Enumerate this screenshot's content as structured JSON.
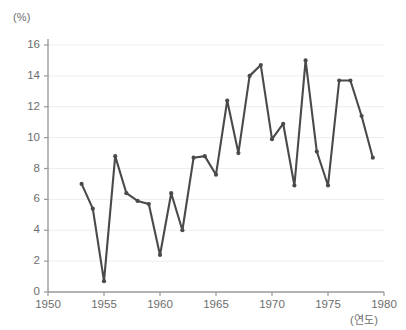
{
  "chart_data": {
    "type": "line",
    "title": "",
    "subtitle": "",
    "xlabel": "(연도)",
    "ylabel": "(%)",
    "xlim": [
      1950,
      1980
    ],
    "ylim": [
      0,
      16
    ],
    "grid": true,
    "legend": false,
    "legend_position": "none",
    "line_color": "#4a4a4a",
    "marker_color": "#4a4a4a",
    "grid_color": "#ededed",
    "axis_color": "#9a9a9a",
    "tick_label_color": "#6d6d6d",
    "y_ticks": [
      "0",
      "2",
      "4",
      "6",
      "8",
      "10",
      "12",
      "14",
      "16"
    ],
    "y_tick_values": [
      0,
      2,
      4,
      6,
      8,
      10,
      12,
      14,
      16
    ],
    "x_ticks": [
      "1950",
      "1955",
      "1960",
      "1965",
      "1970",
      "1975",
      "1980"
    ],
    "x_tick_values": [
      1950,
      1955,
      1960,
      1965,
      1970,
      1975,
      1980
    ],
    "x": [
      1953,
      1954,
      1955,
      1956,
      1957,
      1958,
      1959,
      1960,
      1961,
      1962,
      1963,
      1964,
      1965,
      1966,
      1967,
      1968,
      1969,
      1970,
      1971,
      1972,
      1973,
      1974,
      1975,
      1976,
      1977,
      1978,
      1979
    ],
    "values": [
      7.0,
      5.4,
      0.7,
      8.8,
      6.4,
      5.9,
      5.7,
      2.4,
      6.4,
      4.0,
      8.7,
      8.8,
      7.6,
      12.4,
      9.0,
      14.0,
      14.7,
      9.9,
      10.9,
      6.9,
      15.0,
      9.1,
      6.9,
      13.7,
      13.7,
      11.4,
      8.7
    ],
    "series": [
      {
        "name": "",
        "values": [
          7.0,
          5.4,
          0.7,
          8.8,
          6.4,
          5.9,
          5.7,
          2.4,
          6.4,
          4.0,
          8.7,
          8.8,
          7.6,
          12.4,
          9.0,
          14.0,
          14.7,
          9.9,
          10.9,
          6.9,
          15.0,
          9.1,
          6.9,
          13.7,
          13.7,
          11.4,
          8.7
        ]
      }
    ],
    "annotations": []
  }
}
